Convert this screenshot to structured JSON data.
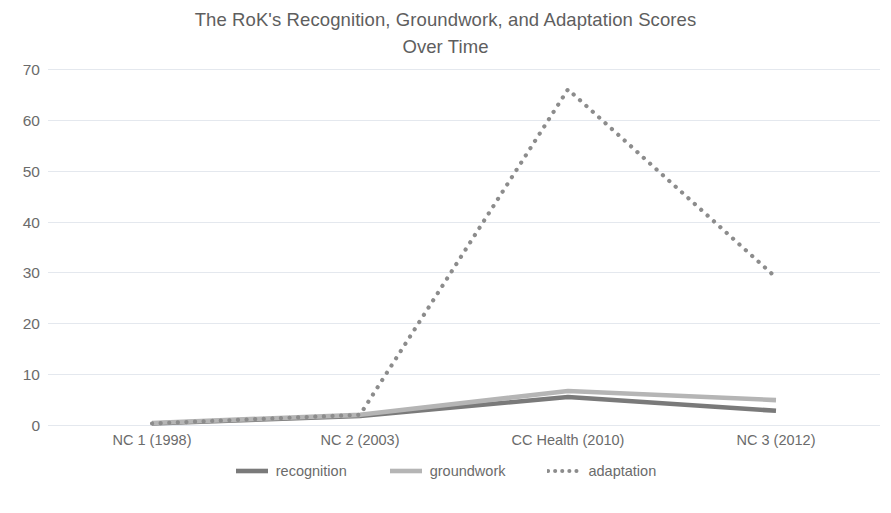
{
  "chart_data": {
    "type": "line",
    "title": "The RoK's Recognition, Groundwork, and Adaptation Scores Over Time",
    "title_line_1": "The RoK's Recognition, Groundwork, and Adaptation Scores",
    "title_line_2": "Over Time",
    "xlabel": "",
    "ylabel": "",
    "categories": [
      "NC 1 (1998)",
      "NC 2 (2003)",
      "CC Health (2010)",
      "NC 3 (2012)"
    ],
    "series": [
      {
        "name": "recognition",
        "values": [
          0.3,
          1.8,
          5.5,
          2.8
        ],
        "color": "#7a7a7a",
        "style": "solid"
      },
      {
        "name": "groundwork",
        "values": [
          0.4,
          2.0,
          6.7,
          4.9
        ],
        "color": "#b5b5b5",
        "style": "solid"
      },
      {
        "name": "adaptation",
        "values": [
          0.3,
          2.0,
          66,
          29
        ],
        "color": "#8c8c8c",
        "style": "dotted"
      }
    ],
    "ylim": [
      0,
      70
    ],
    "y_ticks": [
      0,
      10,
      20,
      30,
      40,
      50,
      60,
      70
    ],
    "grid": true,
    "legend_position": "bottom",
    "background": "#ffffff",
    "grid_color": "#e4e8ee",
    "text_color": "#6b6b6b"
  },
  "legend": {
    "items": [
      {
        "label": "recognition"
      },
      {
        "label": "groundwork"
      },
      {
        "label": "adaptation"
      }
    ]
  }
}
